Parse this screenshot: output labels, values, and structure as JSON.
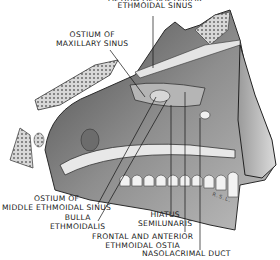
{
  "figure": {
    "labels": [
      {
        "id": "top",
        "line1": "OSTIUM OF POSTERIOR",
        "line2": "ETHMOIDAL SINUS"
      },
      {
        "id": "maxillary",
        "line1": "OSTIUM OF",
        "line2": "MAXILLARY SINUS"
      },
      {
        "id": "middle_ethmoidal",
        "line1": "OSTIUM OF",
        "line2": "MIDDLE ETHMOIDAL SINUS"
      },
      {
        "id": "bulla",
        "line1": "BULLA",
        "line2": "ETHMOIDALIS"
      },
      {
        "id": "hiatus",
        "line1": "HIATUS",
        "line2": "SEMILUNARIS"
      },
      {
        "id": "frontal",
        "line1": "FRONTAL AND ANTERIOR",
        "line2": "ETHMOIDAL OSTIA"
      },
      {
        "id": "nasolacrimal",
        "line1": "NASOLACRIMAL DUCT"
      }
    ],
    "signature": "R.S.L."
  },
  "colors": {
    "ink": "#1a1a1a",
    "shade_dark": "#3a3a3a",
    "shade_mid": "#8a8a8a",
    "shade_light": "#cfcfcf",
    "paper": "#ffffff"
  }
}
